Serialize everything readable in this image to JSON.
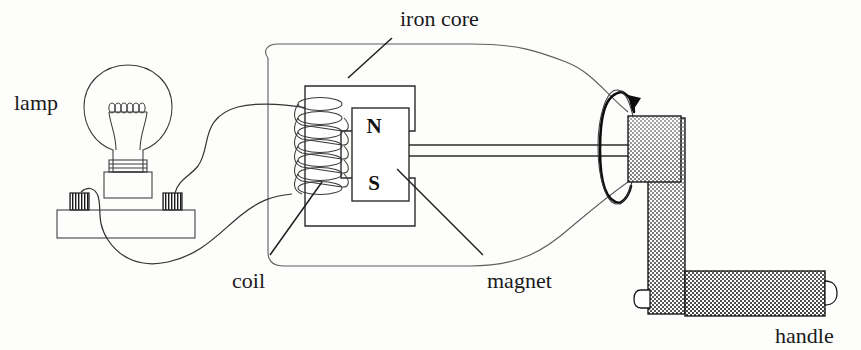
{
  "figure": {
    "background_color": "#fdfdfc",
    "ink_color": "#2b2b2b"
  },
  "labels": {
    "lamp": "lamp",
    "iron_core": "iron core",
    "coil": "coil",
    "magnet": "magnet",
    "handle": "handle"
  },
  "magnet": {
    "north_pole": "N",
    "south_pole": "S"
  },
  "components": {
    "lamp": {
      "name": "lamp",
      "parts": [
        "glass-bulb",
        "coiled-filament",
        "screw-base",
        "socket",
        "base-plate",
        "terminal-post-left",
        "terminal-post-right"
      ]
    },
    "coil": {
      "name": "coil",
      "turns": 7,
      "wound_on": "left limb of iron core"
    },
    "iron_core": {
      "name": "iron core",
      "shape": "C-shaped yoke"
    },
    "magnet": {
      "name": "magnet",
      "shape": "rectangular bar",
      "poles": [
        "N",
        "S"
      ]
    },
    "shaft": {
      "name": "shaft",
      "style": "double-line rod"
    },
    "handle": {
      "name": "handle",
      "parts": [
        "hub",
        "crank-arm",
        "grip",
        "end-cap"
      ],
      "shading": "halftone gradient, dark at top"
    },
    "rotation_indicator": {
      "name": "rotation-arrow",
      "shape": "vertical ellipse with arrowhead",
      "direction": "clockwise"
    },
    "wires": {
      "count": 2,
      "description": "curved leads from lamp terminals to coil ends"
    }
  }
}
